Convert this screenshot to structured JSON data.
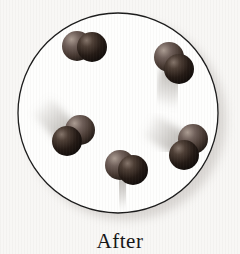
{
  "figure": {
    "label": "After",
    "background": "#f8f7f5",
    "container": {
      "cx": 118,
      "cy": 113,
      "r": 100,
      "fill": "#fefefd",
      "stroke": "#1b1b1b",
      "stroke_width": 1.3,
      "shadow_color": "#c9c5c1",
      "shadow_dx": 8,
      "shadow_dy": 7,
      "shadow_blur": 5,
      "shadow_opacity": 0.65
    },
    "sphere": {
      "radius": 15,
      "light_stops": [
        [
          "0",
          "#ab9c92"
        ],
        [
          "0.3",
          "#70605a"
        ],
        [
          "0.65",
          "#453730"
        ],
        [
          "1",
          "#140f0c"
        ]
      ],
      "dark_stops": [
        [
          "0",
          "#84746a"
        ],
        [
          "0.25",
          "#4e3f36"
        ],
        [
          "0.6",
          "#241a15"
        ],
        [
          "1",
          "#0b0807"
        ]
      ]
    },
    "trail": {
      "rgb": "150,145,139",
      "alpha": 0.55,
      "width": 25,
      "blur": 3.5
    },
    "molecules": [
      {
        "id": "top-left",
        "light": {
          "x": 77,
          "y": 46
        },
        "dark": {
          "x": 92,
          "y": 47
        },
        "trail": {
          "x1": 84,
          "y1": 58,
          "x2": 84,
          "y2": 102
        }
      },
      {
        "id": "top-right",
        "light": {
          "x": 169,
          "y": 57
        },
        "dark": {
          "x": 179,
          "y": 69
        },
        "trail": {
          "x1": 172,
          "y1": 76,
          "x2": 163,
          "y2": 106
        }
      },
      {
        "id": "middle-left",
        "light": {
          "x": 80,
          "y": 130
        },
        "dark": {
          "x": 67,
          "y": 141
        },
        "trail": {
          "x1": 64,
          "y1": 130,
          "x2": 40,
          "y2": 104
        }
      },
      {
        "id": "bottom-center",
        "light": {
          "x": 120,
          "y": 165
        },
        "dark": {
          "x": 133,
          "y": 170
        },
        "trail": {
          "x1": 121,
          "y1": 183,
          "x2": 124,
          "y2": 208
        }
      },
      {
        "id": "right",
        "light": {
          "x": 193,
          "y": 139
        },
        "dark": {
          "x": 184,
          "y": 155
        },
        "trail": {
          "x1": 175,
          "y1": 141,
          "x2": 147,
          "y2": 124
        }
      }
    ]
  }
}
